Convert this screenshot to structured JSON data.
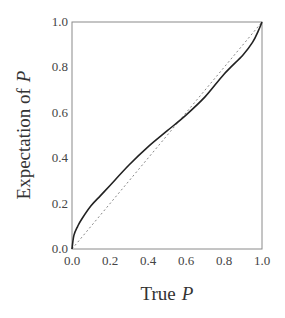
{
  "chart_data": {
    "type": "line",
    "title": "",
    "xlabel": "True",
    "xlabel_var": "P",
    "ylabel": "Expectation of",
    "ylabel_var": "P",
    "xlim": [
      0,
      1
    ],
    "ylim": [
      0,
      1
    ],
    "grid": false,
    "legend": null,
    "x_ticks": [
      "0.0",
      "0.2",
      "0.4",
      "0.6",
      "0.8",
      "1.0"
    ],
    "y_ticks": [
      "0.0",
      "0.2",
      "0.4",
      "0.6",
      "0.8",
      "1.0"
    ],
    "series": [
      {
        "name": "Expectation of P",
        "style": "solid",
        "color": "#222222",
        "x": [
          0.0,
          0.01,
          0.03,
          0.05,
          0.1,
          0.15,
          0.2,
          0.3,
          0.4,
          0.5,
          0.6,
          0.7,
          0.8,
          0.9,
          0.95,
          0.98,
          1.0
        ],
        "y": [
          0.0,
          0.06,
          0.1,
          0.13,
          0.19,
          0.235,
          0.28,
          0.37,
          0.45,
          0.52,
          0.59,
          0.67,
          0.77,
          0.855,
          0.91,
          0.96,
          1.0
        ]
      },
      {
        "name": "identity",
        "style": "dotted",
        "color": "#777777",
        "x": [
          0,
          1
        ],
        "y": [
          0,
          1
        ]
      }
    ]
  }
}
